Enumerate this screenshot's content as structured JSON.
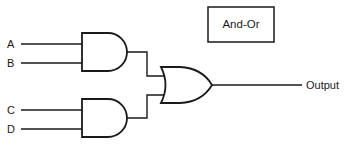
{
  "title": "And-Or",
  "inputs": [
    {
      "label": "A"
    },
    {
      "label": "B"
    },
    {
      "label": "C"
    },
    {
      "label": "D"
    }
  ],
  "gates": [
    {
      "type": "AND",
      "inputs": [
        "A",
        "B"
      ]
    },
    {
      "type": "AND",
      "inputs": [
        "C",
        "D"
      ]
    },
    {
      "type": "OR",
      "inputs": [
        "AND1",
        "AND2"
      ]
    }
  ],
  "output": {
    "label": "Output"
  },
  "colors": {
    "line": "#1a1a1a",
    "background": "#ffffff"
  }
}
